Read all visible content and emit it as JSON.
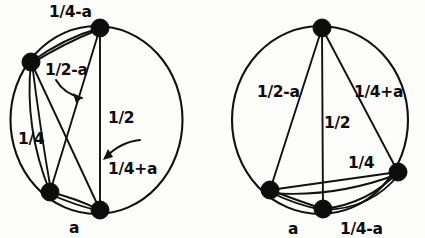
{
  "figure": {
    "background_color": "#fdfdfb",
    "ink_color": "#0d0d0d"
  },
  "diagrams": [
    {
      "id": "left-diagram",
      "name": "left-circle-graph",
      "circle": {
        "cx": 96.5,
        "cy": 120,
        "r": 94,
        "rx": 86,
        "ry": 94
      },
      "nodes": [
        {
          "name": "node-top",
          "cx": 100,
          "cy": 28,
          "r": 9
        },
        {
          "name": "node-upper-left",
          "cx": 31,
          "cy": 62,
          "r": 9
        },
        {
          "name": "node-lower-left",
          "cx": 50,
          "cy": 192,
          "r": 9
        },
        {
          "name": "node-bottom",
          "cx": 100,
          "cy": 210,
          "r": 9
        }
      ],
      "labels": [
        {
          "name": "label-quarter-minus-a",
          "text": "1/4-a",
          "x": 49,
          "y": 17
        },
        {
          "name": "label-half-minus-a",
          "text": "1/2-a",
          "x": 45,
          "y": 75
        },
        {
          "name": "label-half",
          "text": "1/2",
          "x": 108,
          "y": 123
        },
        {
          "name": "label-quarter",
          "text": "1/4",
          "x": 18,
          "y": 144
        },
        {
          "name": "label-quarter-plus-a",
          "text": "1/4+a",
          "x": 108,
          "y": 174
        },
        {
          "name": "label-a",
          "text": "a",
          "x": 69,
          "y": 233
        }
      ],
      "arrows": [
        {
          "name": "arrow-half-minus-a",
          "from": "label-half-minus-a",
          "to": "chord-upperleft-bottom"
        },
        {
          "name": "arrow-quarter-plus-a",
          "from": "label-quarter-plus-a",
          "to": "chord-top-lowerleft"
        }
      ]
    },
    {
      "id": "right-diagram",
      "name": "right-circle-graph",
      "circle": {
        "cx": 320,
        "cy": 120,
        "r": 94,
        "rx": 88,
        "ry": 94
      },
      "nodes": [
        {
          "name": "node-top",
          "cx": 322,
          "cy": 28,
          "r": 9
        },
        {
          "name": "node-lower-left",
          "cx": 270,
          "cy": 190,
          "r": 9
        },
        {
          "name": "node-bottom",
          "cx": 323,
          "cy": 209,
          "r": 9
        },
        {
          "name": "node-right",
          "cx": 398,
          "cy": 172,
          "r": 9
        }
      ],
      "labels": [
        {
          "name": "label-half-minus-a",
          "text": "1/2-a",
          "x": 257,
          "y": 97
        },
        {
          "name": "label-quarter-plus-a",
          "text": "1/4+a",
          "x": 354,
          "y": 97
        },
        {
          "name": "label-half",
          "text": "1/2",
          "x": 324,
          "y": 128
        },
        {
          "name": "label-quarter",
          "text": "1/4",
          "x": 348,
          "y": 168
        },
        {
          "name": "label-a",
          "text": "a",
          "x": 288,
          "y": 234
        },
        {
          "name": "label-quarter-minus-a",
          "text": "1/4-a",
          "x": 340,
          "y": 234
        }
      ],
      "arrows": []
    }
  ]
}
